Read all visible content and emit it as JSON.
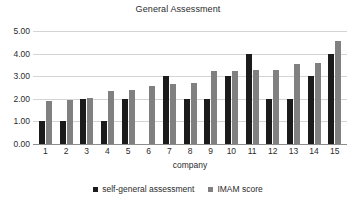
{
  "chart_data": {
    "type": "bar",
    "title": "General Assessment",
    "xlabel": "company",
    "ylabel": "",
    "ylim": [
      0,
      5
    ],
    "ytick_step": 1,
    "ytick_labels": [
      "0.00",
      "1.00",
      "2.00",
      "3.00",
      "4.00",
      "5.00"
    ],
    "grid": true,
    "legend_position": "bottom",
    "categories": [
      "1",
      "2",
      "3",
      "4",
      "5",
      "6",
      "7",
      "8",
      "9",
      "10",
      "11",
      "12",
      "13",
      "14",
      "15"
    ],
    "series": [
      {
        "name": "self-general assessment",
        "color": "#1b1b1b",
        "values": [
          1.0,
          1.0,
          2.0,
          1.0,
          2.0,
          null,
          3.0,
          2.0,
          2.0,
          3.0,
          4.0,
          2.0,
          2.0,
          3.0,
          4.0
        ]
      },
      {
        "name": "IMAM score",
        "color": "#808080",
        "values": [
          1.9,
          1.95,
          2.03,
          2.35,
          2.41,
          2.57,
          2.64,
          2.72,
          3.22,
          3.22,
          3.28,
          3.28,
          3.56,
          3.58,
          4.57
        ]
      }
    ]
  }
}
